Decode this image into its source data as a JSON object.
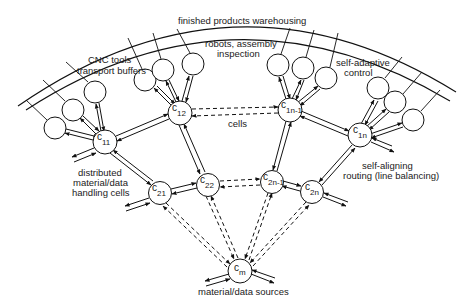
{
  "diagram": {
    "labels": {
      "warehouse": "finished products warehousing",
      "cnc": [
        "CNC tools",
        "transport buffers"
      ],
      "robots": [
        "robots, assembly",
        "inspection"
      ],
      "self_adaptive": [
        "self-adaptive",
        "control"
      ],
      "cells": "cells",
      "distributed": [
        "distributed",
        "material/data",
        "handling cells"
      ],
      "self_aligning": [
        "self-aligning",
        "routing (line balancing)"
      ],
      "sources": "material/data sources"
    },
    "nodes": [
      {
        "id": "c11",
        "base": "c",
        "sub": "11",
        "x": 105,
        "y": 142
      },
      {
        "id": "c12",
        "base": "c",
        "sub": "12",
        "x": 180,
        "y": 113
      },
      {
        "id": "c1n-1",
        "base": "c",
        "sub": "1n-1",
        "x": 290,
        "y": 110
      },
      {
        "id": "c1n",
        "base": "c",
        "sub": "1n",
        "x": 360,
        "y": 135
      },
      {
        "id": "c21",
        "base": "c",
        "sub": "21",
        "x": 160,
        "y": 193
      },
      {
        "id": "c22",
        "base": "c",
        "sub": "22",
        "x": 208,
        "y": 185
      },
      {
        "id": "c2n-1",
        "base": "c",
        "sub": "2n-1",
        "x": 272,
        "y": 182
      },
      {
        "id": "c2n",
        "base": "c",
        "sub": "2n",
        "x": 312,
        "y": 192
      },
      {
        "id": "cm",
        "base": "c",
        "sub": "m",
        "x": 240,
        "y": 271
      }
    ],
    "edges": {
      "solid_bidirectional": [
        [
          "c11",
          "c12"
        ],
        [
          "c11",
          "c21"
        ],
        [
          "c12",
          "c22"
        ],
        [
          "c21",
          "c22"
        ],
        [
          "c1n-1",
          "c1n"
        ],
        [
          "c1n-1",
          "c2n-1"
        ],
        [
          "c1n",
          "c2n"
        ],
        [
          "c2n-1",
          "c2n"
        ]
      ],
      "dashed_bidirectional": [
        [
          "c12",
          "c1n-1"
        ],
        [
          "c22",
          "c2n-1"
        ],
        [
          "c21",
          "cm"
        ],
        [
          "c22",
          "cm"
        ],
        [
          "c2n-1",
          "cm"
        ],
        [
          "c2n",
          "cm"
        ]
      ]
    }
  }
}
